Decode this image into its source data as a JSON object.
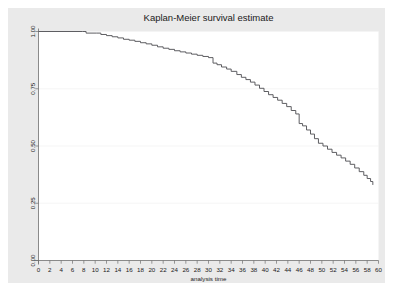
{
  "figure": {
    "background_color": "#ffffff",
    "graph_region_color": "#eaeaea",
    "plot_area_color": "#ffffff"
  },
  "chart_data": {
    "type": "line",
    "subtype": "step",
    "title": "Kaplan-Meier survival estimate",
    "subtitle": "",
    "xlabel": "analysis time",
    "ylabel": "",
    "xlim": [
      0,
      60
    ],
    "ylim": [
      0,
      1
    ],
    "grid": true,
    "grid_axis": "y",
    "legend": false,
    "legend_position": "none",
    "line_color": "#55555a",
    "xticks": [
      0,
      2,
      4,
      6,
      8,
      10,
      12,
      14,
      16,
      18,
      20,
      22,
      24,
      26,
      28,
      30,
      32,
      34,
      36,
      38,
      40,
      42,
      44,
      46,
      48,
      50,
      52,
      54,
      56,
      58,
      60
    ],
    "xticklabels": [
      "0",
      "2",
      "4",
      "6",
      "8",
      "10",
      "12",
      "14",
      "16",
      "18",
      "20",
      "22",
      "24",
      "26",
      "28",
      "30",
      "32",
      "34",
      "36",
      "38",
      "40",
      "42",
      "44",
      "46",
      "48",
      "50",
      "52",
      "54",
      "56",
      "58",
      "60"
    ],
    "yticks": [
      0.0,
      0.25,
      0.5,
      0.75,
      1.0
    ],
    "yticklabels": [
      "0.00",
      "0.25",
      "0.50",
      "0.75",
      "1.00"
    ],
    "series": [
      {
        "name": "survival probability",
        "x": [
          0,
          7.8,
          8.4,
          10.2,
          11.0,
          12.0,
          13.0,
          14.0,
          15.0,
          16.0,
          17.0,
          18.0,
          19.0,
          20.0,
          21.0,
          22.0,
          23.0,
          24.0,
          25.0,
          26.0,
          27.0,
          28.0,
          29.0,
          30.0,
          30.8,
          31.5,
          32.3,
          33.2,
          34.0,
          35.0,
          35.8,
          36.6,
          37.4,
          38.2,
          39.0,
          39.8,
          40.6,
          41.4,
          42.2,
          43.0,
          43.8,
          44.6,
          45.4,
          46.0,
          46.6,
          47.3,
          48.0,
          48.7,
          49.4,
          50.2,
          51.0,
          51.8,
          52.6,
          53.4,
          54.2,
          55.0,
          55.8,
          56.6,
          57.4,
          58.0,
          58.6,
          59.0
        ],
        "y": [
          1.0,
          1.0,
          0.993,
          0.993,
          0.987,
          0.982,
          0.977,
          0.972,
          0.966,
          0.962,
          0.957,
          0.951,
          0.946,
          0.94,
          0.933,
          0.927,
          0.922,
          0.916,
          0.911,
          0.906,
          0.901,
          0.896,
          0.891,
          0.886,
          0.862,
          0.855,
          0.845,
          0.836,
          0.826,
          0.812,
          0.8,
          0.79,
          0.779,
          0.766,
          0.752,
          0.738,
          0.724,
          0.712,
          0.7,
          0.686,
          0.672,
          0.655,
          0.64,
          0.598,
          0.588,
          0.57,
          0.552,
          0.532,
          0.512,
          0.5,
          0.486,
          0.472,
          0.46,
          0.448,
          0.434,
          0.42,
          0.404,
          0.388,
          0.372,
          0.358,
          0.345,
          0.33
        ]
      }
    ]
  }
}
